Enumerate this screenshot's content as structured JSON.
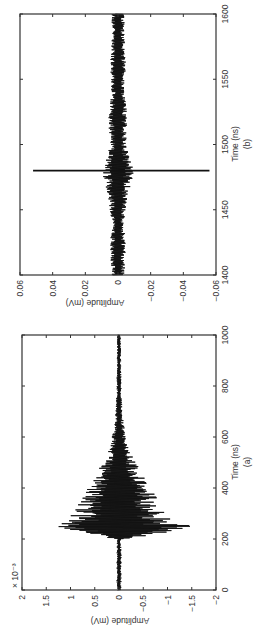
{
  "layout": {
    "rotation_deg": -90,
    "note_visible": "figure rendered rotated 90° counter-clockwise"
  },
  "chart_data": [
    {
      "id": "a",
      "type": "line",
      "caption": "(a)",
      "title": "",
      "xlabel": "Time (ns)",
      "ylabel": "Amplitude (mV)",
      "y_scale_factor": "× 10⁻³",
      "xlim": [
        0,
        1000
      ],
      "ylim": [
        -2,
        2
      ],
      "x_ticks": [
        "0",
        "200",
        "400",
        "600",
        "800",
        "1000"
      ],
      "y_ticks": [
        "2",
        "1.5",
        "1",
        "0.5",
        "0",
        "−0.5",
        "−1",
        "−1.5",
        "−2"
      ],
      "grid": false,
      "series": [
        {
          "name": "signal",
          "description": "noise-like impulse response; near zero before ~220 ns, sharp onset peaking ~250 ns, exponential decay envelope to ~700 ns",
          "envelope_x": [
            0,
            100,
            200,
            220,
            240,
            250,
            260,
            280,
            300,
            320,
            350,
            400,
            450,
            500,
            550,
            600,
            650,
            700,
            800,
            1000
          ],
          "envelope_pos": [
            0.05,
            0.05,
            0.05,
            0.9,
            1.1,
            1.5,
            1.2,
            1.05,
            1.0,
            0.95,
            0.85,
            0.65,
            0.5,
            0.35,
            0.22,
            0.15,
            0.1,
            0.07,
            0.05,
            0.04
          ],
          "envelope_neg": [
            -0.05,
            -0.05,
            -0.05,
            -0.9,
            -1.3,
            -1.55,
            -1.2,
            -1.05,
            -1.0,
            -0.95,
            -0.85,
            -0.65,
            -0.5,
            -0.35,
            -0.22,
            -0.15,
            -0.1,
            -0.07,
            -0.05,
            -0.04
          ]
        }
      ]
    },
    {
      "id": "b",
      "type": "line",
      "caption": "(b)",
      "title": "",
      "xlabel": "Time (ns)",
      "ylabel": "Amplitude (mV)",
      "xlim": [
        1400,
        1600
      ],
      "ylim": [
        -0.06,
        0.06
      ],
      "x_ticks": [
        "1400",
        "1450",
        "1500",
        "1550",
        "1600"
      ],
      "y_ticks": [
        "0.06",
        "0.04",
        "0.02",
        "0",
        "−0.02",
        "−0.04",
        "−0.06"
      ],
      "grid": false,
      "series": [
        {
          "name": "signal",
          "description": "low-level oscillating noise about ±0.005 with a single sharp spike at ~1480 ns",
          "spike_x": 1480,
          "spike_pos": 0.052,
          "spike_neg": -0.056,
          "envelope_x": [
            1400,
            1420,
            1440,
            1460,
            1470,
            1480,
            1490,
            1500,
            1520,
            1540,
            1560,
            1580,
            1600
          ],
          "envelope_pos": [
            0.004,
            0.005,
            0.004,
            0.006,
            0.008,
            0.01,
            0.007,
            0.005,
            0.006,
            0.004,
            0.005,
            0.004,
            0.004
          ],
          "envelope_neg": [
            -0.004,
            -0.005,
            -0.004,
            -0.006,
            -0.008,
            -0.01,
            -0.007,
            -0.005,
            -0.006,
            -0.004,
            -0.005,
            -0.004,
            -0.004
          ]
        }
      ]
    }
  ]
}
